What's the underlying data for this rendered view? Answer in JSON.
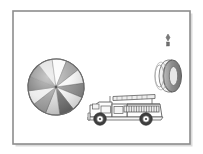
{
  "page": {
    "title": "Illustration Scene",
    "background_color": "#ffffff",
    "width": 203,
    "height": 154
  },
  "frame": {
    "name": "picture-frame",
    "x": 13,
    "y": 11,
    "width": 177,
    "height": 133,
    "fill": "#ffffff",
    "stroke": "#8d8d8d",
    "stroke_width": 1.6,
    "shadow_color": "#bdbdbd"
  },
  "objects": [
    {
      "id": "beach-ball",
      "label": "Beach ball",
      "type": "segmented-sphere",
      "cx": 56,
      "cy": 87,
      "r": 28,
      "outline": "#6b6b6b",
      "segment_count": 12,
      "rotation_deg": -8,
      "segment_colors": [
        "#f2f2f2",
        "#8f8f8f",
        "#d8d8d8",
        "#6e6e6e",
        "#ececec",
        "#9a9a9a",
        "#f7f7f7",
        "#7d7d7d",
        "#dedede",
        "#8a8a8a",
        "#fafafa",
        "#a3a3a3"
      ],
      "shine_color": "#ffffff"
    },
    {
      "id": "fire-truck",
      "label": "Fire truck with ladder",
      "type": "vehicle",
      "x": 88,
      "y": 92,
      "width": 75,
      "height": 32,
      "body_fill": "#fdfdfd",
      "outline": "#5e5e5e",
      "ladder_fill": "#e9e9e9",
      "ladder_rung_color": "#5e5e5e",
      "ladder_rungs": 16,
      "wheel_outer": "#3f3f3f",
      "wheel_inner": "#ffffff",
      "wheel_hub": "#4a4a4a",
      "wheels": 2,
      "detail_fill": "#f3f3f3"
    },
    {
      "id": "hanging-tire",
      "label": "Tire hanging on a rod",
      "type": "tire-on-post",
      "cx": 168,
      "cy": 76,
      "tire_rx": 9,
      "tire_ry": 16,
      "tire_outer": "#8b8b8b",
      "tire_inner": "#efefef",
      "tire_shade": "#b8b8b8",
      "rod_color": "#9a9a9a",
      "rod_top_y": 36,
      "rod_bottom_y": 62,
      "rod_cap_color": "#6f6f6f"
    }
  ]
}
